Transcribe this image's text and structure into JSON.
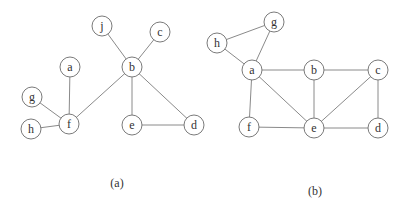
{
  "graphs": [
    {
      "id": "a",
      "caption": "(a)",
      "caption_pos": [
        117,
        183
      ],
      "nodes": [
        {
          "id": "j",
          "label": "j",
          "x": 102,
          "y": 26
        },
        {
          "id": "c",
          "label": "c",
          "x": 160,
          "y": 32
        },
        {
          "id": "b",
          "label": "b",
          "x": 132,
          "y": 67
        },
        {
          "id": "a",
          "label": "a",
          "x": 70,
          "y": 67
        },
        {
          "id": "g",
          "label": "g",
          "x": 32,
          "y": 97
        },
        {
          "id": "f",
          "label": "f",
          "x": 69,
          "y": 124
        },
        {
          "id": "h",
          "label": "h",
          "x": 31,
          "y": 129
        },
        {
          "id": "e",
          "label": "e",
          "x": 132,
          "y": 125
        },
        {
          "id": "d",
          "label": "d",
          "x": 194,
          "y": 125
        }
      ],
      "edges": [
        [
          "j",
          "b"
        ],
        [
          "c",
          "b"
        ],
        [
          "b",
          "f"
        ],
        [
          "b",
          "e"
        ],
        [
          "b",
          "d"
        ],
        [
          "e",
          "d"
        ],
        [
          "a",
          "f"
        ],
        [
          "g",
          "f"
        ],
        [
          "h",
          "f"
        ]
      ]
    },
    {
      "id": "b",
      "caption": "(b)",
      "caption_pos": [
        315,
        191
      ],
      "nodes": [
        {
          "id": "g",
          "label": "g",
          "x": 274,
          "y": 22
        },
        {
          "id": "h",
          "label": "h",
          "x": 217,
          "y": 43
        },
        {
          "id": "a",
          "label": "a",
          "x": 252,
          "y": 70
        },
        {
          "id": "b",
          "label": "b",
          "x": 314,
          "y": 70
        },
        {
          "id": "c",
          "label": "c",
          "x": 378,
          "y": 70
        },
        {
          "id": "f",
          "label": "f",
          "x": 249,
          "y": 127
        },
        {
          "id": "e",
          "label": "e",
          "x": 314,
          "y": 128
        },
        {
          "id": "d",
          "label": "d",
          "x": 378,
          "y": 128
        }
      ],
      "edges": [
        [
          "h",
          "g"
        ],
        [
          "h",
          "a"
        ],
        [
          "g",
          "a"
        ],
        [
          "a",
          "b"
        ],
        [
          "b",
          "c"
        ],
        [
          "a",
          "f"
        ],
        [
          "a",
          "e"
        ],
        [
          "b",
          "e"
        ],
        [
          "c",
          "e"
        ],
        [
          "c",
          "d"
        ],
        [
          "f",
          "e"
        ],
        [
          "e",
          "d"
        ]
      ]
    }
  ],
  "style": {
    "node_radius": 10,
    "stroke_color": "#7a7a7a",
    "edge_color": "#8a8a8a",
    "background": "#ffffff"
  }
}
